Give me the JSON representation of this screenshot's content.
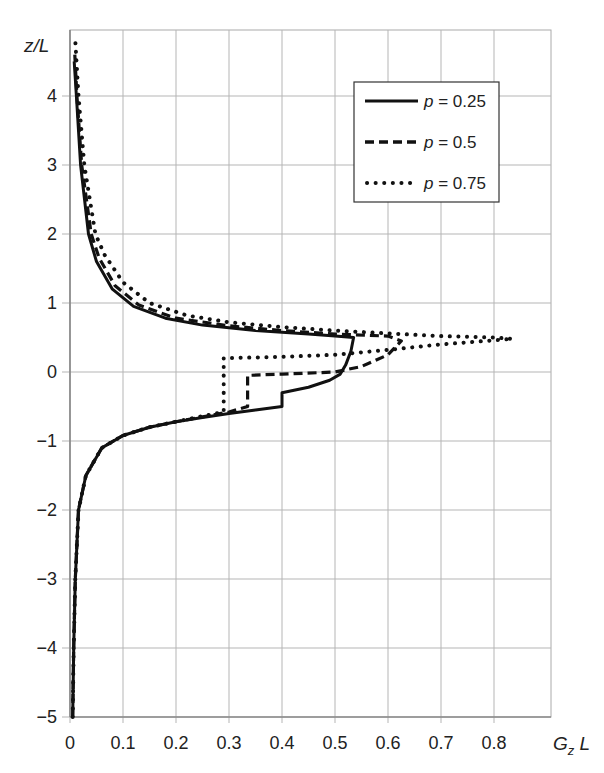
{
  "chart_data": {
    "type": "line",
    "title": "",
    "xlabel": "G_z L",
    "ylabel": "z/L",
    "xlim": [
      0,
      0.9
    ],
    "ylim": [
      -5,
      5
    ],
    "grid": true,
    "legend_position": "upper right",
    "x_ticks": [
      "0",
      "0.1",
      "0.2",
      "0.3",
      "0.4",
      "0.5",
      "0.6",
      "0.7",
      "0.8"
    ],
    "y_ticks": [
      "-5",
      "-4",
      "-3",
      "-2",
      "-1",
      "0",
      "1",
      "2",
      "3",
      "4"
    ],
    "series": [
      {
        "name": "p = 0.25",
        "style": "solid",
        "points": [
          [
            0.005,
            -5
          ],
          [
            0.007,
            -4
          ],
          [
            0.01,
            -3
          ],
          [
            0.016,
            -2
          ],
          [
            0.03,
            -1.5
          ],
          [
            0.06,
            -1.1
          ],
          [
            0.1,
            -0.92
          ],
          [
            0.15,
            -0.8
          ],
          [
            0.2,
            -0.72
          ],
          [
            0.25,
            -0.66
          ],
          [
            0.3,
            -0.6
          ],
          [
            0.35,
            -0.55
          ],
          [
            0.4,
            -0.5
          ],
          [
            0.4,
            -0.3
          ],
          [
            0.45,
            -0.22
          ],
          [
            0.49,
            -0.12
          ],
          [
            0.51,
            -0.03
          ],
          [
            0.52,
            0.1
          ],
          [
            0.53,
            0.3
          ],
          [
            0.535,
            0.5
          ],
          [
            0.5,
            0.52
          ],
          [
            0.45,
            0.55
          ],
          [
            0.35,
            0.6
          ],
          [
            0.25,
            0.68
          ],
          [
            0.18,
            0.78
          ],
          [
            0.12,
            0.95
          ],
          [
            0.08,
            1.2
          ],
          [
            0.05,
            1.6
          ],
          [
            0.035,
            2
          ],
          [
            0.02,
            3
          ],
          [
            0.012,
            4
          ],
          [
            0.008,
            4.5
          ]
        ]
      },
      {
        "name": "p = 0.5",
        "style": "dashed",
        "points": [
          [
            0.005,
            -5
          ],
          [
            0.007,
            -4
          ],
          [
            0.01,
            -3
          ],
          [
            0.016,
            -2
          ],
          [
            0.03,
            -1.5
          ],
          [
            0.06,
            -1.1
          ],
          [
            0.1,
            -0.92
          ],
          [
            0.15,
            -0.8
          ],
          [
            0.2,
            -0.72
          ],
          [
            0.25,
            -0.65
          ],
          [
            0.3,
            -0.58
          ],
          [
            0.335,
            -0.5
          ],
          [
            0.335,
            -0.05
          ],
          [
            0.4,
            -0.03
          ],
          [
            0.5,
            0
          ],
          [
            0.55,
            0.08
          ],
          [
            0.6,
            0.25
          ],
          [
            0.625,
            0.45
          ],
          [
            0.6,
            0.52
          ],
          [
            0.5,
            0.55
          ],
          [
            0.4,
            0.6
          ],
          [
            0.3,
            0.67
          ],
          [
            0.2,
            0.78
          ],
          [
            0.13,
            0.97
          ],
          [
            0.085,
            1.25
          ],
          [
            0.055,
            1.65
          ],
          [
            0.04,
            2
          ],
          [
            0.022,
            3
          ],
          [
            0.013,
            4
          ],
          [
            0.009,
            4.6
          ]
        ]
      },
      {
        "name": "p = 0.75",
        "style": "dotted",
        "points": [
          [
            0.005,
            -5
          ],
          [
            0.007,
            -4
          ],
          [
            0.01,
            -3
          ],
          [
            0.016,
            -2
          ],
          [
            0.03,
            -1.5
          ],
          [
            0.06,
            -1.1
          ],
          [
            0.1,
            -0.92
          ],
          [
            0.15,
            -0.8
          ],
          [
            0.2,
            -0.72
          ],
          [
            0.25,
            -0.64
          ],
          [
            0.29,
            -0.58
          ],
          [
            0.29,
            0.2
          ],
          [
            0.4,
            0.22
          ],
          [
            0.5,
            0.25
          ],
          [
            0.6,
            0.32
          ],
          [
            0.7,
            0.4
          ],
          [
            0.8,
            0.46
          ],
          [
            0.835,
            0.48
          ],
          [
            0.8,
            0.5
          ],
          [
            0.7,
            0.52
          ],
          [
            0.6,
            0.56
          ],
          [
            0.5,
            0.6
          ],
          [
            0.4,
            0.65
          ],
          [
            0.3,
            0.72
          ],
          [
            0.22,
            0.82
          ],
          [
            0.15,
            1.0
          ],
          [
            0.1,
            1.3
          ],
          [
            0.065,
            1.7
          ],
          [
            0.048,
            2
          ],
          [
            0.027,
            3
          ],
          [
            0.016,
            4
          ],
          [
            0.01,
            4.8
          ]
        ]
      }
    ]
  },
  "axes": {
    "x_label_main": "G",
    "x_label_sub": "z",
    "x_label_tail": " L",
    "y_label": "z/L"
  },
  "legend": {
    "items": [
      {
        "var": "p",
        "text": " = 0.25",
        "style": "solid"
      },
      {
        "var": "p",
        "text": " = 0.5",
        "style": "dashed"
      },
      {
        "var": "p",
        "text": " = 0.75",
        "style": "dotted"
      }
    ]
  }
}
